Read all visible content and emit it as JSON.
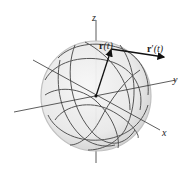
{
  "diagram": {
    "type": "3d-vector-diagram",
    "axes": {
      "x_label": "x",
      "y_label": "y",
      "z_label": "z"
    },
    "vectors": {
      "position": {
        "bold": "r",
        "arg": "(t)"
      },
      "tangent": {
        "bold": "r",
        "prime": "′",
        "arg": "(t)"
      }
    },
    "colors": {
      "sphere_fill": "#e6e6e6",
      "sphere_edge": "#bdbdbd",
      "curve": "#555555",
      "axis": "#333333",
      "vector": "#111111"
    }
  }
}
